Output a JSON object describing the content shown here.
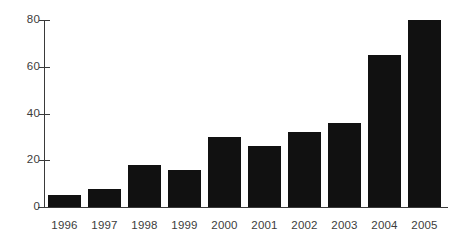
{
  "chart_data": {
    "type": "bar",
    "title": "",
    "subtitle": "",
    "xlabel": "",
    "ylabel": "",
    "categories": [
      "1996",
      "1997",
      "1998",
      "1999",
      "2000",
      "2001",
      "2002",
      "2003",
      "2004",
      "2005"
    ],
    "values": [
      5,
      7.5,
      18,
      16,
      30,
      26,
      32,
      36,
      65,
      80
    ],
    "ylim": [
      0,
      80
    ],
    "yticks": [
      0,
      20,
      40,
      60,
      80
    ],
    "ytick_labels": [
      "0",
      "20",
      "40",
      "60",
      "80"
    ],
    "grid": false,
    "legend": false,
    "legend_position": "none",
    "bar_color": "#111111",
    "axis_color": "#3a3a3a",
    "tick_label_color": "#3c3c3c",
    "background_color": "#ffffff",
    "annotations": []
  }
}
